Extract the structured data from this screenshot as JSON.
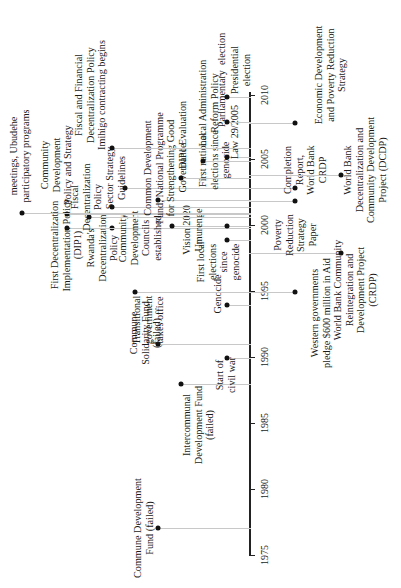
{
  "chart_data": {
    "type": "timeline",
    "orientation": "rotated-90-ccw",
    "axis": {
      "min": 1975,
      "max": 2010,
      "ticks": [
        1975,
        1980,
        1985,
        1990,
        1995,
        2000,
        2005,
        2010
      ]
    },
    "events_above": [
      {
        "year": 1976.5,
        "label": "Commune Development\nFund (failed)"
      },
      {
        "year": 1987.5,
        "label": "Intercommunal\nDevelopment Fund\n(failed)"
      },
      {
        "year": 1989.5,
        "label": "Start of\ncivil war"
      },
      {
        "year": 1990.5,
        "label": "Commune\nSolidarity Fund\n(failed)"
      },
      {
        "year": 1994.0,
        "label": "Genocide"
      },
      {
        "year": 1994.5,
        "label": "Transitional\ngovernment\ntakes office"
      },
      {
        "year": 1999.0,
        "label": "First local\nelections\nsince\ngenocide"
      },
      {
        "year": 2000.0,
        "label": "Rwanda's\nDecentralization\nPolicy"
      },
      {
        "year": 2000.0,
        "label": "First Decentralization\nImplementation Policy\n(DIP1)"
      },
      {
        "year": 2000.0,
        "label": "Vision 2020\nUmurenge"
      },
      {
        "year": 2001.0,
        "label": "Community\nDevelopment\nCouncils\nestablished"
      },
      {
        "year": 2001.0,
        "label": "Fiscal\nDecentralization\nPolicy"
      },
      {
        "year": 2001.0,
        "label": "Community\nDevelopment\nPolicy and Strategy"
      },
      {
        "year": 2001.0,
        "label": "meetings, Ubudehe\nparticipatory programs"
      },
      {
        "year": 2002.0,
        "label": "Sector Strategy\nGuidelines"
      },
      {
        "year": 2002.5,
        "label": "First national\nelections since\ngenocide"
      },
      {
        "year": 2003.0,
        "label": "Common Development\nFund; National Programme\nfor Strengthening Good\nGovernance"
      },
      {
        "year": 2004.0,
        "label": "DIP1 Evaluation"
      },
      {
        "year": 2005.0,
        "label": "Local Administration\nReform Policy"
      },
      {
        "year": 2005.0,
        "label": "Law 29/2005"
      },
      {
        "year": 2006.0,
        "label": "Fiscal and Financial\nDecentralization Policy\nImihigo contracting begins"
      },
      {
        "year": 2008.0,
        "label": "Parliamentary  election"
      },
      {
        "year": 2010.0,
        "label": "Presidential\nelection"
      }
    ],
    "events_below": [
      {
        "year": 1994.5,
        "label": "Western governments\npledge $600 million in Aid"
      },
      {
        "year": 1998.0,
        "label": "World Bank Community\nReintegration and\nDevelopment Project\n(CRDP)"
      },
      {
        "year": 2002.0,
        "label": "Poverty\nReduction\nStrategy\nPaper"
      },
      {
        "year": 2003.0,
        "label": "Completion\nReport,\nWorld Bank\nCRDP"
      },
      {
        "year": 2004.0,
        "label": "World Bank\nDecentralization and\nCommunity Development\nProject (DCDP)"
      },
      {
        "year": 2007.0,
        "label": "Economic Development\nand Poverty Reduction\nStrategy"
      }
    ]
  },
  "axis": {
    "ticks": [
      {
        "label": "1975",
        "y": 555
      },
      {
        "label": "1980",
        "y": 489
      },
      {
        "label": "1985",
        "y": 423
      },
      {
        "label": "1990",
        "y": 357
      },
      {
        "label": "1995",
        "y": 291
      },
      {
        "label": "2000",
        "y": 225
      },
      {
        "label": "2005",
        "y": 159
      },
      {
        "label": "2010",
        "y": 95
      }
    ]
  },
  "events": [
    {
      "label": "Commune Development\nFund (failed)",
      "dot_x": 158,
      "dot_y": 528,
      "lx": 143,
      "ly": 528
    },
    {
      "label": "Intercommunal\nDevelopment Fund\n(failed)",
      "dot_x": 181,
      "dot_y": 384,
      "lx": 198,
      "ly": 425
    },
    {
      "label": "Start of\ncivil war",
      "dot_x": 227,
      "dot_y": 358,
      "lx": 225,
      "ly": 375
    },
    {
      "label": "Commune\nSolidarity Fund\n(failed)",
      "dot_x": 158,
      "dot_y": 344,
      "lx": 145,
      "ly": 333
    },
    {
      "label": "Genocide",
      "dot_x": 227,
      "dot_y": 305,
      "lx": 218,
      "ly": 294
    },
    {
      "label": "Transitional\ngovernment\ntakes office",
      "dot_x": 135,
      "dot_y": 292,
      "lx": 148,
      "ly": 320
    },
    {
      "label": "First local\nelections\nsince\ngenocide",
      "dot_x": 227,
      "dot_y": 240,
      "lx": 218,
      "ly": 262
    },
    {
      "label": "Rwanda's\nDecentralization\nPolicy",
      "dot_x": 112,
      "dot_y": 228,
      "lx": 102,
      "ly": 248
    },
    {
      "label": "First Decentralization\nImplementation Policy\n(DIP1)",
      "dot_x": 67,
      "dot_y": 228,
      "lx": 66,
      "ly": 245
    },
    {
      "label": "Vision 2020\nUmurenge",
      "dot_x": 172,
      "dot_y": 226,
      "lx": 192,
      "ly": 230
    },
    {
      "label": "Community\nDevelopment\nCouncils\nestablished",
      "dot_x": 112,
      "dot_y": 207,
      "lx": 140,
      "ly": 238
    },
    {
      "label": "Fiscal\nDecentralization\nPolicy",
      "dot_x": 89,
      "dot_y": 217,
      "lx": 86,
      "ly": 197
    },
    {
      "label": "Community\nDevelopment\nPolicy and Strategy",
      "dot_x": 67,
      "dot_y": 214,
      "lx": 56,
      "ly": 165
    },
    {
      "label": "meetings, Ubudehe\nparticipatory programs",
      "dot_x": 22,
      "dot_y": 213,
      "lx": 19,
      "ly": 156
    },
    {
      "label": "Sector Strategy\nGuidelines",
      "dot_x": 125,
      "dot_y": 188,
      "lx": 115,
      "ly": 178
    },
    {
      "label": "First national\nelections since\ngenocide",
      "dot_x": 227,
      "dot_y": 226,
      "lx": 214,
      "ly": 160
    },
    {
      "label": "Common Development\nFund; National Programme\nfor Strengthening Good\nGovernance",
      "dot_x": 158,
      "dot_y": 200,
      "lx": 165,
      "ly": 168
    },
    {
      "label": "DIP1 Evaluation",
      "dot_x": 181,
      "dot_y": 178,
      "lx": 183,
      "ly": 135
    },
    {
      "label": "Local Administration\nReform Policy",
      "dot_x": 203,
      "dot_y": 161,
      "lx": 208,
      "ly": 103
    },
    {
      "label": "Law 29/2005",
      "dot_x": 227,
      "dot_y": 157,
      "lx": 235,
      "ly": 132
    },
    {
      "label": "Fiscal and Financial\nDecentralization Policy\nImihigo contracting begins",
      "dot_x": 112,
      "dot_y": 148,
      "lx": 90,
      "ly": 95
    },
    {
      "label": "Parliamentary  election",
      "dot_x": 227,
      "dot_y": 122,
      "lx": 222,
      "ly": 80
    },
    {
      "label": "Presidential\nelection",
      "dot_x": 227,
      "dot_y": 97,
      "lx": 240,
      "ly": 70
    },
    {
      "label": "Western governments\npledge $600 million in Aid",
      "dot_x": 295,
      "dot_y": 292,
      "lx": 320,
      "ly": 313
    },
    {
      "label": "World Bank Community\nReintegration and\nDevelopment Project\n(CRDP)",
      "dot_x": 341,
      "dot_y": 253,
      "lx": 355,
      "ly": 290
    },
    {
      "label": "Poverty\nReduction\nStrategy\nPaper",
      "dot_x": 295,
      "dot_y": 201,
      "lx": 295,
      "ly": 235
    },
    {
      "label": "Completion\nReport,\nWorld Bank\nCRDP",
      "dot_x": 295,
      "dot_y": 188,
      "lx": 305,
      "ly": 170
    },
    {
      "label": "World Bank\nDecentralization and\nCommunity Development\nProject (DCDP)",
      "dot_x": 341,
      "dot_y": 175,
      "lx": 365,
      "ly": 170
    },
    {
      "label": "Economic Development\nand Poverty Reduction\nStrategy",
      "dot_x": 295,
      "dot_y": 123,
      "lx": 330,
      "ly": 75
    }
  ]
}
